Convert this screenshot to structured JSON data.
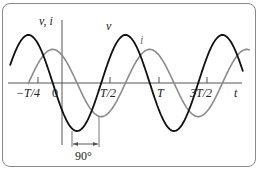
{
  "figure": {
    "type": "phase-diagram",
    "y_axis_label": "v, i",
    "x_axis_label": "t",
    "x_ticks": [
      {
        "label": "−T/4",
        "t": -0.25
      },
      {
        "label": "0",
        "t": 0
      },
      {
        "label": "T/2",
        "t": 0.5
      },
      {
        "label": "T",
        "t": 1.0
      },
      {
        "label": "3T/2",
        "t": 1.5
      }
    ],
    "curves": [
      {
        "name": "v",
        "label": "v",
        "color": "#111111",
        "amplitude": 1.0,
        "phase_deg": 0,
        "description": "voltage"
      },
      {
        "name": "i",
        "label": "i",
        "color": "#8c8c8c",
        "amplitude": 0.7,
        "phase_deg": -90,
        "description": "current lags voltage by 90 degrees"
      }
    ],
    "phase_annotation": "90°",
    "colors": {
      "voltage": "#111111",
      "current": "#8c8c8c",
      "axis": "#555555",
      "frame": "#8a8a8a"
    }
  }
}
